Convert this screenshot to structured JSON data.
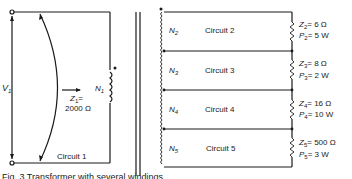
{
  "diagram": {
    "primary": {
      "voltage_label": "V",
      "voltage_sub": "1",
      "impedance_label": "Z",
      "impedance_sub": "1",
      "impedance_eq": "=",
      "impedance_value": "2000 Ω",
      "winding_label": "N",
      "winding_sub": "1",
      "circuit_label": "Circuit 1"
    },
    "secondaries": [
      {
        "winding": "N",
        "winding_sub": "2",
        "circuit": "Circuit 2",
        "z_sub": "2",
        "z_value": "= 6 Ω",
        "p_sub": "2",
        "p_value": "= 5 W"
      },
      {
        "winding": "N",
        "winding_sub": "3",
        "circuit": "Circuit 3",
        "z_sub": "3",
        "z_value": "= 8 Ω",
        "p_sub": "3",
        "p_value": "= 2 W"
      },
      {
        "winding": "N",
        "winding_sub": "4",
        "circuit": "Circuit 4",
        "z_sub": "4",
        "z_value": "= 16 Ω",
        "p_sub": "4",
        "p_value": "= 10 W"
      },
      {
        "winding": "N",
        "winding_sub": "5",
        "circuit": "Circuit 5",
        "z_sub": "5",
        "z_value": "= 500 Ω",
        "p_sub": "5",
        "p_value": "= 3 W"
      }
    ],
    "z_symbol": "Z",
    "p_symbol": "P",
    "caption": "Fig. 3   Transformer with several windings"
  }
}
